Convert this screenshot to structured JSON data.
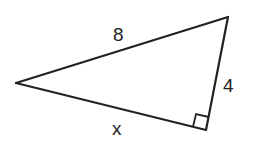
{
  "diagram": {
    "type": "right-triangle",
    "vertices": {
      "left": {
        "x": 16,
        "y": 83
      },
      "top_right": {
        "x": 228,
        "y": 17
      },
      "right_angle": {
        "x": 206,
        "y": 130
      }
    },
    "sides": {
      "hypotenuse": {
        "label": "8",
        "from": "left",
        "to": "top_right"
      },
      "short_leg": {
        "label": "4",
        "from": "top_right",
        "to": "right_angle"
      },
      "long_leg": {
        "label": "x",
        "from": "left",
        "to": "right_angle"
      }
    },
    "right_angle_marker": {
      "at": "right_angle",
      "size": 14
    },
    "colors": {
      "stroke": "#222222",
      "background": "#ffffff"
    }
  }
}
